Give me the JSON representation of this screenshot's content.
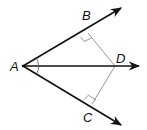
{
  "diagram": {
    "type": "geometry",
    "colors": {
      "stroke": "#111111",
      "perpendicular": "#7a7a7a",
      "background": "#ffffff"
    },
    "points": {
      "A": {
        "label": "A",
        "x": 23,
        "y": 66
      },
      "B": {
        "label": "B",
        "x": 88,
        "y": 33
      },
      "C": {
        "label": "C",
        "x": 92,
        "y": 104
      },
      "D": {
        "label": "D",
        "x": 115,
        "y": 66
      }
    },
    "rays": [
      {
        "name": "ray-AB",
        "from": "A",
        "through": "B",
        "arrow": true
      },
      {
        "name": "ray-AD",
        "from": "A",
        "through": "D",
        "arrow": true
      },
      {
        "name": "ray-AC",
        "from": "A",
        "through": "C",
        "arrow": true
      }
    ],
    "segments": [
      {
        "name": "segment-DB",
        "from": "D",
        "to": "B"
      },
      {
        "name": "segment-DC",
        "from": "D",
        "to": "C"
      }
    ],
    "right_angle_marks": [
      "B",
      "C"
    ],
    "congruent_angle_marks": [
      "angle-BAD",
      "angle-DAC"
    ]
  }
}
